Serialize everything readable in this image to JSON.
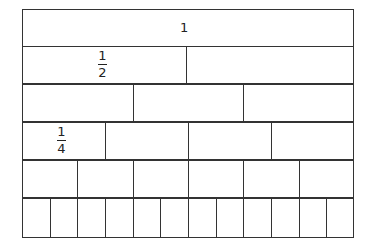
{
  "diagram": {
    "rows": [
      {
        "denominator": 1,
        "parts": 1,
        "label": {
          "text": "1",
          "numerator": "",
          "denominator": ""
        }
      },
      {
        "denominator": 2,
        "parts": 2,
        "label": {
          "numerator": "1",
          "denominator": "2"
        }
      },
      {
        "denominator": 3,
        "parts": 3,
        "label": null
      },
      {
        "denominator": 4,
        "parts": 4,
        "label": {
          "numerator": "1",
          "denominator": "4"
        }
      },
      {
        "denominator": 6,
        "parts": 6,
        "label": null
      },
      {
        "denominator": 12,
        "parts": 12,
        "label": null
      }
    ],
    "whole_label": "1",
    "half_numerator": "1",
    "half_denominator": "2",
    "quarter_numerator": "1",
    "quarter_denominator": "4",
    "line_color": "#333333"
  }
}
